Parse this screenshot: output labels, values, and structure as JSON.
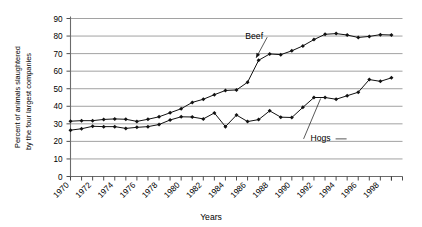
{
  "chart_data": {
    "type": "line",
    "title": "",
    "xlabel": "Years",
    "ylabel": "Percent of animals slaughtered by the four largest companies",
    "ylabel_line1": "Percent of animals slaughtered",
    "ylabel_line2": "by the four largest companies",
    "xlim": [
      1970,
      2000
    ],
    "ylim": [
      0,
      90
    ],
    "ytick_step": 10,
    "xtick_step": 1,
    "xlabel_step": 2,
    "grid": true,
    "legend": "inline-annotations",
    "yticks": [
      "0",
      "10",
      "20",
      "30",
      "40",
      "50",
      "60",
      "70",
      "80",
      "90"
    ],
    "xticks": [
      "1970",
      "1971",
      "1972",
      "1973",
      "1974",
      "1975",
      "1976",
      "1977",
      "1978",
      "1979",
      "1980",
      "1981",
      "1982",
      "1983",
      "1984",
      "1985",
      "1986",
      "1987",
      "1988",
      "1989",
      "1990",
      "1991",
      "1992",
      "1993",
      "1994",
      "1995",
      "1996",
      "1997",
      "1998",
      "1999"
    ],
    "xtick_labels": [
      "1970",
      "1972",
      "1974",
      "1976",
      "1978",
      "1980",
      "1982",
      "1984",
      "1986",
      "1988",
      "1990",
      "1992",
      "1994",
      "1996",
      "1998"
    ],
    "x": [
      1970,
      1971,
      1972,
      1973,
      1974,
      1975,
      1976,
      1977,
      1978,
      1979,
      1980,
      1981,
      1982,
      1983,
      1984,
      1985,
      1986,
      1987,
      1988,
      1989,
      1990,
      1991,
      1992,
      1993,
      1994,
      1995,
      1996,
      1997,
      1998,
      1999
    ],
    "series": [
      {
        "name": "Beef",
        "color": "#111111",
        "values": [
          31.5,
          31.8,
          31.8,
          32.5,
          32.8,
          32.6,
          31.4,
          32.6,
          34.0,
          36.3,
          38.6,
          42.2,
          44.0,
          46.6,
          49.0,
          49.3,
          53.7,
          66.2,
          69.8,
          69.4,
          71.6,
          74.4,
          78.0,
          81.0,
          81.4,
          80.6,
          79.2,
          79.8,
          80.8,
          80.6
        ],
        "label_x": 1986.6,
        "label_y": 78.5
      },
      {
        "name": "Hogs",
        "color": "#111111",
        "values": [
          26.4,
          27.2,
          28.6,
          28.4,
          28.4,
          27.4,
          28.0,
          28.4,
          29.6,
          32.2,
          34.0,
          33.9,
          32.8,
          36.2,
          28.4,
          35.0,
          31.3,
          32.4,
          37.4,
          33.8,
          33.6,
          39.4,
          45.0,
          45.0,
          44.0,
          46.0,
          48.0,
          55.2,
          54.2,
          56.2
        ],
        "label_x": 1992.6,
        "label_y": 20.0
      }
    ]
  },
  "annotations": {
    "beef_label": "Beef",
    "hogs_label": "Hogs",
    "x_axis_title": "Years"
  }
}
